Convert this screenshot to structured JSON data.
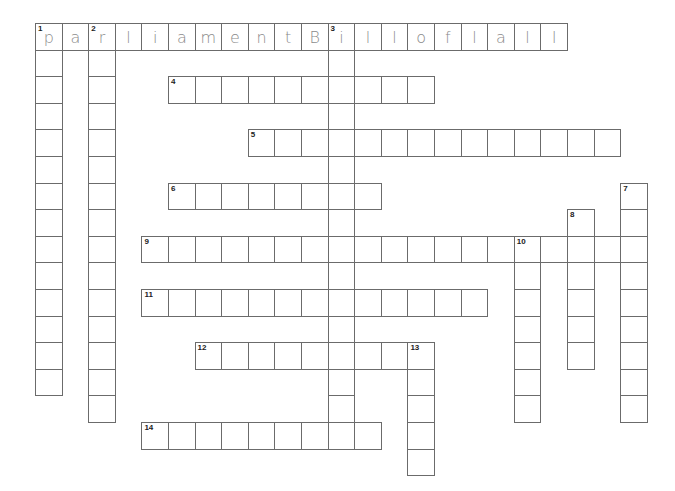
{
  "puzzle": {
    "grid": {
      "origin_x": 35,
      "origin_y": 23,
      "cell_size": 26.6,
      "border_color": "#6b6b6b",
      "letter_color": "#8a8a8a"
    },
    "entries": [
      {
        "number": 1,
        "direction": "across",
        "row": 0,
        "col": 0,
        "length": 20,
        "answer": [
          "p",
          "a",
          "r",
          "l",
          "i",
          "a",
          "m",
          "e",
          "n",
          "t",
          "B",
          "i",
          "l",
          "l",
          "o",
          "f",
          "l",
          "a",
          "l",
          "l"
        ]
      },
      {
        "number": 2,
        "direction": "down",
        "row": 0,
        "col": 2,
        "length": 15,
        "answer": []
      },
      {
        "number": 3,
        "direction": "down",
        "row": 0,
        "col": 11,
        "length": 16,
        "answer": []
      },
      {
        "number": 4,
        "direction": "across",
        "row": 2,
        "col": 5,
        "length": 10,
        "answer": []
      },
      {
        "number": 5,
        "direction": "across",
        "row": 4,
        "col": 8,
        "length": 14,
        "answer": []
      },
      {
        "number": 6,
        "direction": "across",
        "row": 6,
        "col": 5,
        "length": 8,
        "answer": []
      },
      {
        "number": 7,
        "direction": "down",
        "row": 6,
        "col": 22,
        "length": 9,
        "answer": []
      },
      {
        "number": 8,
        "direction": "down",
        "row": 7,
        "col": 20,
        "length": 6,
        "answer": []
      },
      {
        "number": 9,
        "direction": "across",
        "row": 8,
        "col": 4,
        "length": 19,
        "answer": []
      },
      {
        "number": 10,
        "direction": "down",
        "row": 8,
        "col": 18,
        "length": 7,
        "answer": []
      },
      {
        "number": 11,
        "direction": "across",
        "row": 10,
        "col": 4,
        "length": 13,
        "answer": []
      },
      {
        "number": 12,
        "direction": "across",
        "row": 12,
        "col": 6,
        "length": 9,
        "answer": []
      },
      {
        "number": 13,
        "direction": "down",
        "row": 12,
        "col": 14,
        "length": 5,
        "answer": []
      },
      {
        "number": 14,
        "direction": "across",
        "row": 15,
        "col": 4,
        "length": 9,
        "answer": []
      }
    ],
    "extra_down": [
      {
        "number": 1,
        "direction": "down",
        "row": 0,
        "col": 0,
        "length": 14
      }
    ]
  }
}
